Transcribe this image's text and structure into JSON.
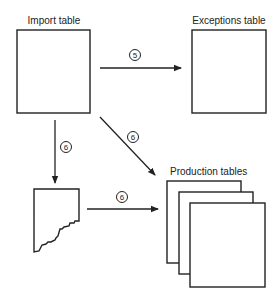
{
  "diagram": {
    "nodes": {
      "import_table": {
        "label": "Import table"
      },
      "exceptions_table": {
        "label": "Exceptions table"
      },
      "torn_document": {
        "label": ""
      },
      "production_tables": {
        "label": "Production tables"
      }
    },
    "edges": [
      {
        "id": "import-to-exceptions",
        "from": "import_table",
        "to": "exceptions_table",
        "step": "5"
      },
      {
        "id": "import-to-torn-doc",
        "from": "import_table",
        "to": "torn_document",
        "step": "6"
      },
      {
        "id": "import-to-production",
        "from": "import_table",
        "to": "production_tables",
        "step": "6"
      },
      {
        "id": "torn-doc-to-production",
        "from": "torn_document",
        "to": "production_tables",
        "step": "6"
      }
    ],
    "colors": {
      "stroke": "#222222",
      "background": "#ffffff"
    }
  }
}
